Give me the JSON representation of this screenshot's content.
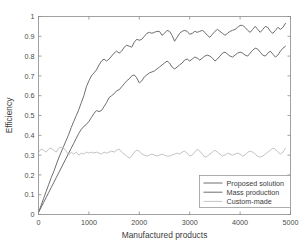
{
  "chart_data": {
    "type": "line",
    "title": "",
    "xlabel": "Manufactured products",
    "ylabel": "Efficiency",
    "xlim": [
      0,
      5000
    ],
    "ylim": [
      0,
      1
    ],
    "xticks": [
      0,
      1000,
      2000,
      3000,
      4000,
      5000
    ],
    "xtick_labels": [
      "0",
      "1000",
      "2000",
      "3000",
      "4000",
      "5000"
    ],
    "yticks": [
      0,
      0.1,
      0.2,
      0.3,
      0.4,
      0.5,
      0.6,
      0.7,
      0.8,
      0.9,
      1
    ],
    "ytick_labels": [
      "0",
      "0.1",
      "0.2",
      "0.3",
      "0.4",
      "0.5",
      "0.6",
      "0.7",
      "0.8",
      "0.9",
      "1"
    ],
    "grid": false,
    "legend_position": "lower-right",
    "series": [
      {
        "name": "Proposed solution",
        "color": "#6e6e6e",
        "x": [
          0,
          50,
          100,
          150,
          200,
          250,
          300,
          350,
          400,
          450,
          500,
          550,
          600,
          650,
          700,
          750,
          800,
          850,
          900,
          950,
          1000,
          1050,
          1100,
          1150,
          1200,
          1250,
          1300,
          1350,
          1400,
          1450,
          1500,
          1550,
          1600,
          1650,
          1700,
          1750,
          1800,
          1850,
          1900,
          1950,
          2000,
          2050,
          2100,
          2150,
          2200,
          2250,
          2300,
          2350,
          2400,
          2450,
          2500,
          2550,
          2600,
          2650,
          2700,
          2750,
          2800,
          2850,
          2900,
          2950,
          3000,
          3050,
          3100,
          3150,
          3200,
          3250,
          3300,
          3350,
          3400,
          3450,
          3500,
          3550,
          3600,
          3650,
          3700,
          3750,
          3800,
          3850,
          3900,
          3950,
          4000,
          4050,
          4100,
          4150,
          4200,
          4250,
          4300,
          4350,
          4400,
          4450,
          4500,
          4550,
          4600,
          4650,
          4700,
          4750,
          4800,
          4850,
          4900
        ],
        "y": [
          0.01,
          0.045,
          0.08,
          0.115,
          0.15,
          0.185,
          0.215,
          0.25,
          0.285,
          0.315,
          0.345,
          0.375,
          0.405,
          0.44,
          0.47,
          0.5,
          0.53,
          0.565,
          0.6,
          0.645,
          0.675,
          0.7,
          0.715,
          0.73,
          0.755,
          0.775,
          0.785,
          0.775,
          0.785,
          0.8,
          0.815,
          0.825,
          0.815,
          0.825,
          0.845,
          0.855,
          0.85,
          0.845,
          0.87,
          0.885,
          0.88,
          0.885,
          0.9,
          0.915,
          0.92,
          0.915,
          0.92,
          0.925,
          0.925,
          0.905,
          0.915,
          0.93,
          0.925,
          0.905,
          0.875,
          0.895,
          0.915,
          0.925,
          0.93,
          0.925,
          0.91,
          0.915,
          0.925,
          0.92,
          0.925,
          0.93,
          0.92,
          0.905,
          0.895,
          0.91,
          0.925,
          0.935,
          0.925,
          0.915,
          0.905,
          0.915,
          0.925,
          0.93,
          0.935,
          0.945,
          0.955,
          0.955,
          0.945,
          0.93,
          0.92,
          0.935,
          0.95,
          0.935,
          0.92,
          0.935,
          0.95,
          0.945,
          0.925,
          0.915,
          0.93,
          0.945,
          0.935,
          0.945,
          0.965
        ]
      },
      {
        "name": "Mass production",
        "color": "#6e6e6e",
        "x": [
          0,
          50,
          100,
          150,
          200,
          250,
          300,
          350,
          400,
          450,
          500,
          550,
          600,
          650,
          700,
          750,
          800,
          850,
          900,
          950,
          1000,
          1050,
          1100,
          1150,
          1200,
          1250,
          1300,
          1350,
          1400,
          1450,
          1500,
          1550,
          1600,
          1650,
          1700,
          1750,
          1800,
          1850,
          1900,
          1950,
          2000,
          2050,
          2100,
          2150,
          2200,
          2250,
          2300,
          2350,
          2400,
          2450,
          2500,
          2550,
          2600,
          2650,
          2700,
          2750,
          2800,
          2850,
          2900,
          2950,
          3000,
          3050,
          3100,
          3150,
          3200,
          3250,
          3300,
          3350,
          3400,
          3450,
          3500,
          3550,
          3600,
          3650,
          3700,
          3750,
          3800,
          3850,
          3900,
          3950,
          4000,
          4050,
          4100,
          4150,
          4200,
          4250,
          4300,
          4350,
          4400,
          4450,
          4500,
          4550,
          4600,
          4650,
          4700,
          4750,
          4800,
          4850,
          4900
        ],
        "y": [
          0.01,
          0.035,
          0.06,
          0.085,
          0.11,
          0.135,
          0.16,
          0.185,
          0.21,
          0.235,
          0.26,
          0.285,
          0.31,
          0.335,
          0.36,
          0.385,
          0.41,
          0.43,
          0.445,
          0.455,
          0.47,
          0.49,
          0.51,
          0.525,
          0.52,
          0.525,
          0.545,
          0.565,
          0.59,
          0.6,
          0.61,
          0.625,
          0.63,
          0.645,
          0.66,
          0.675,
          0.685,
          0.7,
          0.705,
          0.69,
          0.665,
          0.675,
          0.695,
          0.705,
          0.715,
          0.72,
          0.725,
          0.735,
          0.745,
          0.755,
          0.765,
          0.775,
          0.765,
          0.745,
          0.735,
          0.745,
          0.755,
          0.765,
          0.78,
          0.785,
          0.775,
          0.785,
          0.795,
          0.79,
          0.78,
          0.79,
          0.8,
          0.805,
          0.8,
          0.79,
          0.775,
          0.785,
          0.8,
          0.815,
          0.82,
          0.81,
          0.8,
          0.795,
          0.805,
          0.815,
          0.82,
          0.815,
          0.805,
          0.8,
          0.815,
          0.83,
          0.84,
          0.835,
          0.82,
          0.805,
          0.8,
          0.815,
          0.825,
          0.81,
          0.795,
          0.805,
          0.825,
          0.84,
          0.85
        ]
      },
      {
        "name": "Custom-made",
        "color": "#c4c4c4",
        "x": [
          0,
          50,
          100,
          150,
          200,
          250,
          300,
          350,
          400,
          450,
          500,
          550,
          600,
          650,
          700,
          750,
          800,
          850,
          900,
          950,
          1000,
          1050,
          1100,
          1150,
          1200,
          1250,
          1300,
          1350,
          1400,
          1450,
          1500,
          1550,
          1600,
          1650,
          1700,
          1750,
          1800,
          1850,
          1900,
          1950,
          2000,
          2050,
          2100,
          2150,
          2200,
          2250,
          2300,
          2350,
          2400,
          2450,
          2500,
          2550,
          2600,
          2650,
          2700,
          2750,
          2800,
          2850,
          2900,
          2950,
          3000,
          3050,
          3100,
          3150,
          3200,
          3250,
          3300,
          3350,
          3400,
          3450,
          3500,
          3550,
          3600,
          3650,
          3700,
          3750,
          3800,
          3850,
          3900,
          3950,
          4000,
          4050,
          4100,
          4150,
          4200,
          4250,
          4300,
          4350,
          4400,
          4450,
          4500,
          4550,
          4600,
          4650,
          4700,
          4750,
          4800,
          4850,
          4900
        ],
        "y": [
          0.315,
          0.33,
          0.325,
          0.315,
          0.33,
          0.335,
          0.325,
          0.315,
          0.335,
          0.34,
          0.335,
          0.32,
          0.3,
          0.315,
          0.305,
          0.315,
          0.3,
          0.31,
          0.305,
          0.315,
          0.31,
          0.315,
          0.31,
          0.315,
          0.31,
          0.305,
          0.315,
          0.31,
          0.315,
          0.32,
          0.315,
          0.325,
          0.33,
          0.315,
          0.305,
          0.295,
          0.285,
          0.295,
          0.315,
          0.325,
          0.32,
          0.305,
          0.3,
          0.295,
          0.3,
          0.305,
          0.3,
          0.295,
          0.3,
          0.305,
          0.3,
          0.295,
          0.295,
          0.3,
          0.305,
          0.31,
          0.305,
          0.315,
          0.32,
          0.31,
          0.295,
          0.3,
          0.315,
          0.33,
          0.32,
          0.305,
          0.29,
          0.295,
          0.305,
          0.315,
          0.325,
          0.315,
          0.305,
          0.295,
          0.3,
          0.31,
          0.305,
          0.3,
          0.305,
          0.31,
          0.305,
          0.295,
          0.3,
          0.315,
          0.32,
          0.315,
          0.305,
          0.295,
          0.29,
          0.295,
          0.305,
          0.315,
          0.325,
          0.335,
          0.33,
          0.315,
          0.305,
          0.315,
          0.335
        ]
      }
    ]
  },
  "legend": {
    "entries": [
      {
        "label": "Proposed solution"
      },
      {
        "label": "Mass production"
      },
      {
        "label": "Custom-made"
      }
    ]
  }
}
